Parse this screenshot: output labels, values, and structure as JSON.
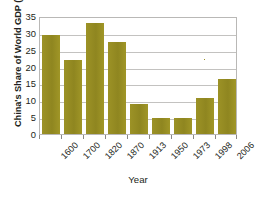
{
  "chart_data": {
    "type": "bar",
    "title": "",
    "xlabel": "Year",
    "ylabel": "China's Share of World GDP (%)",
    "categories": [
      "1600",
      "1700",
      "1820",
      "1870",
      "1913",
      "1950",
      "1973",
      "1998",
      "2006"
    ],
    "values": [
      29.5,
      22.0,
      33.0,
      27.3,
      9.0,
      4.8,
      4.8,
      10.8,
      16.2
    ],
    "ylim": [
      0,
      35
    ],
    "yticks": [
      0,
      5,
      10,
      15,
      20,
      25,
      30,
      35
    ],
    "ytick_labels": [
      "0",
      "5",
      "10",
      "15",
      "20",
      "25",
      "30",
      "35"
    ],
    "grid": "horizontal",
    "legend": "none",
    "bar_color": "#9a9024",
    "frame_color": "#b9b8b6",
    "grid_color": "#c3c2c0",
    "text_color": "#231f20"
  }
}
